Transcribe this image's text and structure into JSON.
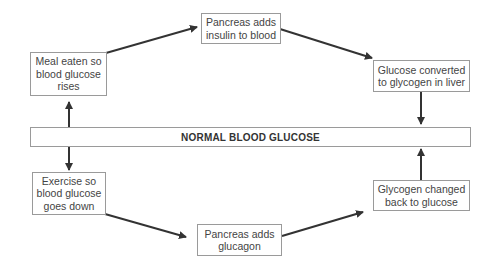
{
  "diagram": {
    "center": {
      "label": "NORMAL BLOOD GLUCOSE"
    },
    "nodes": [
      {
        "id": "meal",
        "label": "Meal eaten so\nblood glucose\nrises"
      },
      {
        "id": "insulin",
        "label": "Pancreas adds\ninsulin to blood"
      },
      {
        "id": "glucose_to_glycogen",
        "label": "Glucose converted\nto glycogen in liver"
      },
      {
        "id": "exercise",
        "label": "Exercise so\nblood glucose\ngoes down"
      },
      {
        "id": "glucagon",
        "label": "Pancreas adds\nglucagon"
      },
      {
        "id": "glycogen_to_glucose",
        "label": "Glycogen changed\nback to glucose"
      }
    ],
    "edges": [
      {
        "from": "normal",
        "to": "meal"
      },
      {
        "from": "meal",
        "to": "insulin"
      },
      {
        "from": "insulin",
        "to": "glucose_to_glycogen"
      },
      {
        "from": "glucose_to_glycogen",
        "to": "normal"
      },
      {
        "from": "normal",
        "to": "exercise"
      },
      {
        "from": "exercise",
        "to": "glucagon"
      },
      {
        "from": "glucagon",
        "to": "glycogen_to_glucose"
      },
      {
        "from": "glycogen_to_glucose",
        "to": "normal"
      }
    ],
    "colors": {
      "line": "#3a3a3a",
      "border": "#9a9a9a"
    }
  }
}
